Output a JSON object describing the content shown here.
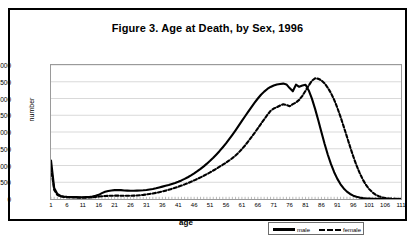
{
  "figure": {
    "title": "Figure 3. Age at Death, by Sex, 1996"
  },
  "axes": {
    "xlabel": "age",
    "ylabel": "number"
  },
  "legend": {
    "male_label": "male",
    "female_label": "female"
  },
  "chart_data": {
    "type": "line",
    "title": "Figure 3. Age at Death, by Sex, 1996",
    "xlabel": "age",
    "ylabel": "number",
    "xlim": [
      1,
      111
    ],
    "ylim": [
      0,
      4000
    ],
    "yticks": [
      0,
      500,
      1000,
      1500,
      2000,
      2500,
      3000,
      3500,
      4000
    ],
    "xticks": [
      1,
      6,
      11,
      16,
      21,
      26,
      31,
      36,
      41,
      46,
      51,
      56,
      61,
      66,
      71,
      76,
      81,
      86,
      91,
      96,
      101,
      106,
      111
    ],
    "grid": "horizontal",
    "legend_position": "bottom-right",
    "x": [
      1,
      2,
      3,
      4,
      5,
      6,
      7,
      8,
      9,
      10,
      11,
      12,
      13,
      14,
      15,
      16,
      17,
      18,
      19,
      20,
      21,
      22,
      23,
      24,
      25,
      26,
      27,
      28,
      29,
      30,
      31,
      32,
      33,
      34,
      35,
      36,
      37,
      38,
      39,
      40,
      41,
      42,
      43,
      44,
      45,
      46,
      47,
      48,
      49,
      50,
      51,
      52,
      53,
      54,
      55,
      56,
      57,
      58,
      59,
      60,
      61,
      62,
      63,
      64,
      65,
      66,
      67,
      68,
      69,
      70,
      71,
      72,
      73,
      74,
      75,
      76,
      77,
      78,
      79,
      80,
      81,
      82,
      83,
      84,
      85,
      86,
      87,
      88,
      89,
      90,
      91,
      92,
      93,
      94,
      95,
      96,
      97,
      98,
      99,
      100,
      101,
      102,
      103,
      104,
      105,
      106,
      107,
      108,
      109,
      110,
      111
    ],
    "series": [
      {
        "name": "male",
        "style": "solid",
        "values": [
          1150,
          330,
          150,
          90,
          75,
          65,
          60,
          58,
          55,
          52,
          50,
          55,
          60,
          75,
          95,
          125,
          175,
          215,
          240,
          255,
          265,
          270,
          265,
          255,
          250,
          245,
          245,
          250,
          255,
          260,
          270,
          285,
          300,
          320,
          345,
          370,
          395,
          420,
          450,
          480,
          515,
          555,
          600,
          650,
          705,
          765,
          830,
          900,
          975,
          1055,
          1140,
          1230,
          1330,
          1435,
          1545,
          1660,
          1785,
          1915,
          2050,
          2190,
          2330,
          2470,
          2610,
          2745,
          2875,
          3000,
          3110,
          3205,
          3285,
          3345,
          3390,
          3420,
          3435,
          3445,
          3420,
          3310,
          3215,
          3415,
          3350,
          3385,
          3410,
          3240,
          2995,
          2690,
          2350,
          1990,
          1640,
          1320,
          1040,
          800,
          600,
          440,
          315,
          220,
          150,
          100,
          65,
          42,
          27,
          17,
          11,
          7,
          5,
          3,
          2,
          1,
          1,
          1,
          0,
          0,
          0
        ]
      },
      {
        "name": "female",
        "style": "dashed",
        "values": [
          930,
          270,
          125,
          75,
          62,
          55,
          48,
          45,
          43,
          41,
          40,
          42,
          45,
          52,
          62,
          72,
          82,
          90,
          95,
          98,
          100,
          100,
          98,
          96,
          95,
          96,
          100,
          106,
          114,
          124,
          136,
          150,
          166,
          184,
          204,
          226,
          250,
          276,
          304,
          334,
          366,
          400,
          436,
          474,
          514,
          556,
          600,
          646,
          694,
          744,
          796,
          850,
          906,
          964,
          1024,
          1086,
          1150,
          1220,
          1300,
          1390,
          1490,
          1600,
          1720,
          1845,
          1975,
          2110,
          2245,
          2380,
          2510,
          2630,
          2700,
          2740,
          2790,
          2830,
          2805,
          2770,
          2830,
          2880,
          2960,
          3080,
          3230,
          3390,
          3530,
          3600,
          3590,
          3540,
          3450,
          3320,
          3160,
          2960,
          2720,
          2450,
          2160,
          1860,
          1560,
          1270,
          1010,
          780,
          580,
          420,
          295,
          200,
          130,
          82,
          50,
          30,
          17,
          10,
          6,
          3,
          1
        ]
      }
    ]
  }
}
